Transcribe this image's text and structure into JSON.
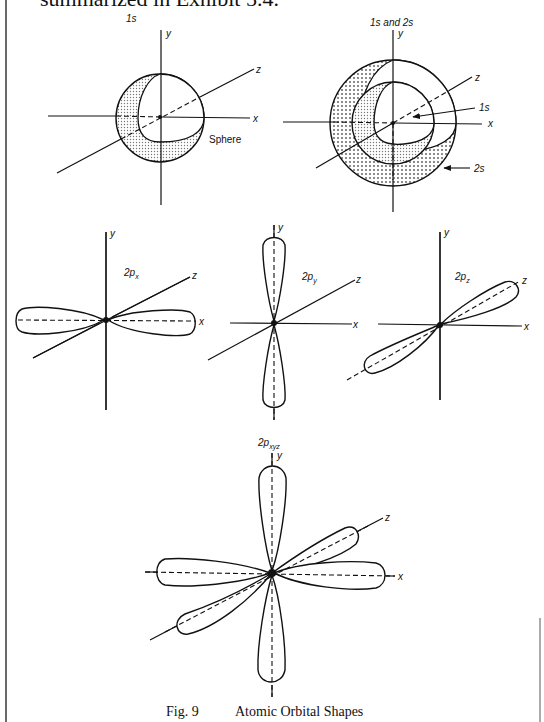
{
  "header": {
    "clipped_text": "summarized in Exhibit 5.4."
  },
  "figure": {
    "caption_number": "Fig. 9",
    "caption_title": "Atomic Orbital Shapes",
    "panels": {
      "s1": {
        "title": "1s",
        "axis_y": "y",
        "axis_x": "x",
        "axis_z": "z",
        "annotation": "Sphere"
      },
      "s12": {
        "title": "1s and 2s",
        "axis_y": "y",
        "axis_x": "x",
        "axis_z": "z",
        "inner_label": "1s",
        "outer_label": "2s"
      },
      "px": {
        "title_main": "2p",
        "title_sub": "x",
        "axis_y": "y",
        "axis_x": "x",
        "axis_z": "z"
      },
      "py": {
        "title_main": "2p",
        "title_sub": "y",
        "axis_y": "y",
        "axis_x": "x",
        "axis_z": "z"
      },
      "pz": {
        "title_main": "2p",
        "title_sub": "z",
        "axis_y": "y",
        "axis_x": "x",
        "axis_z": "z"
      },
      "pxyz": {
        "title_main": "2p",
        "title_sub": "xyz",
        "axis_y": "y",
        "axis_x": "x",
        "axis_z": "z"
      }
    }
  },
  "colors": {
    "ink": "#111111",
    "paper": "#ffffff",
    "stipple": "#9a9a9a"
  }
}
